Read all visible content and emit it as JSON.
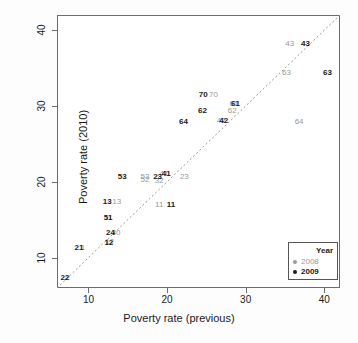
{
  "chart_data": {
    "type": "scatter",
    "title": "",
    "xlabel": "Poverty rate (previous)",
    "ylabel": "Poverty rate (2010)",
    "xlim": [
      6,
      42
    ],
    "ylim": [
      6,
      42
    ],
    "xticks": [
      10,
      20,
      30,
      40
    ],
    "yticks": [
      10,
      20,
      30,
      40
    ],
    "grid": false,
    "reference_line": {
      "type": "identity",
      "style": "dashed",
      "color": "#999999",
      "label": "y = x"
    },
    "point_marker": "text-label",
    "legend": {
      "title": "Year",
      "position": "bottom-right",
      "entries": [
        {
          "label": "2008",
          "color": "#9a9a9a"
        },
        {
          "label": "2009",
          "color": "#1a1a1a"
        }
      ]
    },
    "series": [
      {
        "name": "2008",
        "color": "#9a9a9a",
        "points": [
          {
            "label": "2",
            "x": 7.4,
            "y": 7.3
          },
          {
            "label": "1",
            "x": 9.3,
            "y": 11.3
          },
          {
            "label": "12",
            "x": 12.7,
            "y": 12.1
          },
          {
            "label": "30",
            "x": 13.5,
            "y": 13.3
          },
          {
            "label": "11",
            "x": 12.5,
            "y": 15.2
          },
          {
            "label": "13",
            "x": 13.6,
            "y": 17.3
          },
          {
            "label": "52",
            "x": 17.2,
            "y": 20.2
          },
          {
            "label": "53",
            "x": 17.2,
            "y": 20.6
          },
          {
            "label": "32",
            "x": 19.0,
            "y": 20.1
          },
          {
            "label": "41",
            "x": 19.6,
            "y": 21.0
          },
          {
            "label": "23",
            "x": 22.2,
            "y": 20.6
          },
          {
            "label": "11",
            "x": 19.0,
            "y": 17.0
          },
          {
            "label": "42",
            "x": 26.9,
            "y": 28.0
          },
          {
            "label": "62",
            "x": 28.3,
            "y": 29.3
          },
          {
            "label": "61",
            "x": 28.5,
            "y": 30.2
          },
          {
            "label": "70",
            "x": 25.9,
            "y": 31.4
          },
          {
            "label": "64",
            "x": 36.8,
            "y": 27.9
          },
          {
            "label": "63",
            "x": 35.2,
            "y": 34.4
          },
          {
            "label": "43",
            "x": 35.6,
            "y": 38.2
          }
        ]
      },
      {
        "name": "2009",
        "color": "#1a1a1a",
        "points": [
          {
            "label": "22",
            "x": 7.0,
            "y": 7.3
          },
          {
            "label": "21",
            "x": 8.8,
            "y": 11.3
          },
          {
            "label": "12",
            "x": 12.6,
            "y": 12.0
          },
          {
            "label": "24",
            "x": 12.8,
            "y": 13.3
          },
          {
            "label": "51",
            "x": 12.5,
            "y": 15.2
          },
          {
            "label": "13",
            "x": 12.4,
            "y": 17.3
          },
          {
            "label": "53",
            "x": 14.3,
            "y": 20.6
          },
          {
            "label": "23",
            "x": 18.8,
            "y": 20.6
          },
          {
            "label": "41",
            "x": 19.9,
            "y": 21.0
          },
          {
            "label": "11",
            "x": 20.5,
            "y": 17.0
          },
          {
            "label": "42",
            "x": 27.2,
            "y": 28.0
          },
          {
            "label": "62",
            "x": 24.5,
            "y": 29.3
          },
          {
            "label": "61",
            "x": 28.7,
            "y": 30.3
          },
          {
            "label": "70",
            "x": 24.6,
            "y": 31.4
          },
          {
            "label": "64",
            "x": 22.1,
            "y": 27.9
          },
          {
            "label": "63",
            "x": 40.4,
            "y": 34.4
          },
          {
            "label": "43",
            "x": 37.6,
            "y": 38.2
          }
        ]
      }
    ]
  }
}
